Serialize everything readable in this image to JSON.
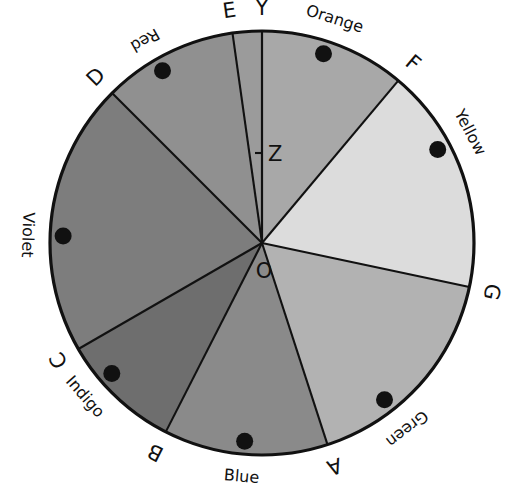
{
  "figure": {
    "center_point_label": "O",
    "vertical_axis_label": "Y",
    "tick_label": "Z",
    "circle": {
      "cx": 262,
      "cy": 243,
      "r": 212
    },
    "outline_color": "#111111"
  },
  "chart_data": {
    "type": "pie",
    "xlabel": "",
    "ylabel": "",
    "center_label": "O",
    "axis_label": "Y",
    "tick_label": "Z",
    "categories": [
      "Orange",
      "Yellow",
      "Green",
      "Blue",
      "Indigo",
      "Violet",
      "Red"
    ],
    "values": [
      40,
      62,
      60,
      45,
      33,
      75,
      45
    ],
    "units": "degrees",
    "sectors": [
      {
        "name": "Orange",
        "start_spoke": "Y",
        "end_spoke": "F",
        "start_deg": 90,
        "end_deg": 50,
        "sweep_deg": 40,
        "fill": "#a8a8a8",
        "dot_deg": 72
      },
      {
        "name": "Yellow",
        "start_spoke": "F",
        "end_spoke": "G",
        "start_deg": 50,
        "end_deg": -12,
        "sweep_deg": 62,
        "fill": "#dcdcdc",
        "dot_deg": 28
      },
      {
        "name": "Green",
        "start_spoke": "G",
        "end_spoke": "A",
        "start_deg": -12,
        "end_deg": -72,
        "sweep_deg": 60,
        "fill": "#b2b2b2",
        "dot_deg": -52
      },
      {
        "name": "Blue",
        "start_spoke": "A",
        "end_spoke": "B",
        "start_deg": -72,
        "end_deg": -117,
        "sweep_deg": 45,
        "fill": "#8a8a8a",
        "dot_deg": -95
      },
      {
        "name": "Indigo",
        "start_spoke": "B",
        "end_spoke": "C",
        "start_deg": -117,
        "end_deg": -150,
        "sweep_deg": 33,
        "fill": "#6e6e6e",
        "dot_deg": -139
      },
      {
        "name": "Violet",
        "start_spoke": "C",
        "end_spoke": "D",
        "start_deg": -150,
        "end_deg": 135,
        "sweep_deg": 75,
        "fill": "#7d7d7d",
        "dot_deg": 178
      },
      {
        "name": "Red",
        "start_spoke": "D",
        "end_spoke": "E",
        "start_deg": 135,
        "end_deg": 98,
        "sweep_deg": 37,
        "fill": "#909090",
        "dot_deg": 120
      },
      {
        "name": "Sliver",
        "start_spoke": "E",
        "end_spoke": "Y",
        "start_deg": 98,
        "end_deg": 90,
        "sweep_deg": 8,
        "fill": "#9b9b9b",
        "dot_deg": null
      }
    ],
    "spokes": [
      {
        "label": "Y",
        "deg": 90
      },
      {
        "label": "F",
        "deg": 50
      },
      {
        "label": "G",
        "deg": -12
      },
      {
        "label": "A",
        "deg": -72
      },
      {
        "label": "B",
        "deg": -117
      },
      {
        "label": "C",
        "deg": -150
      },
      {
        "label": "D",
        "deg": 135
      },
      {
        "label": "E",
        "deg": 98
      }
    ],
    "arc_labels": [
      {
        "text": "Orange",
        "deg": 72,
        "flip": false
      },
      {
        "text": "Yellow",
        "deg": 28,
        "flip": false
      },
      {
        "text": "Green",
        "deg": -52,
        "flip": false
      },
      {
        "text": "Blue",
        "deg": -95,
        "flip": true
      },
      {
        "text": "Indigo",
        "deg": -139,
        "flip": true
      },
      {
        "text": "Violet",
        "deg": 178,
        "flip": true
      },
      {
        "text": "Red",
        "deg": 120,
        "flip": true
      }
    ],
    "markers": {
      "shape": "filled-circle",
      "color": "#111111",
      "count": 7
    },
    "legend": "none",
    "grid": false
  }
}
